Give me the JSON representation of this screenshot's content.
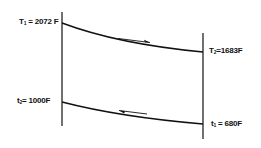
{
  "diagram": {
    "type": "counterflow heat exchanger temperature profile",
    "colors": {
      "line": "#111111",
      "background": "#ffffff"
    },
    "hot_stream": {
      "inlet": {
        "symbol": "T",
        "sub": "1",
        "eq": " = ",
        "value": "2072 F"
      },
      "outlet": {
        "symbol": "T",
        "sub": "2",
        "eq": "=",
        "value": "1683F"
      },
      "flow_direction": "right"
    },
    "cold_stream": {
      "outlet": {
        "symbol": "t",
        "sub": "2",
        "eq": "= ",
        "value": "1000F"
      },
      "inlet": {
        "symbol": "t",
        "sub": "1",
        "eq": " = ",
        "value": "680F"
      },
      "flow_direction": "left"
    }
  }
}
